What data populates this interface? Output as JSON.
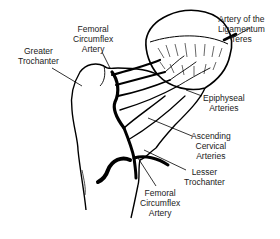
{
  "diagram": {
    "colors": {
      "line": "#000000",
      "text": "#1a1a1a",
      "background": "#ffffff"
    },
    "labels": {
      "femoral_circumflex_top": {
        "lines": [
          "Femoral",
          "Circumflex",
          "Artery"
        ]
      },
      "greater_trochanter": {
        "lines": [
          "Greater",
          "Trochanter"
        ]
      },
      "artery_ligamentum_teres": {
        "lines": [
          "Artery of the",
          "Ligamentum",
          "Teres"
        ]
      },
      "epiphyseal_arteries": {
        "lines": [
          "Epiphyseal",
          "Arteries"
        ]
      },
      "ascending_cervical_arteries": {
        "lines": [
          "Ascending",
          "Cervical",
          "Arteries"
        ]
      },
      "lesser_trochanter": {
        "lines": [
          "Lesser",
          "Trochanter"
        ]
      },
      "femoral_circumflex_bottom": {
        "lines": [
          "Femoral",
          "Circumflex",
          "Artery"
        ]
      }
    }
  }
}
